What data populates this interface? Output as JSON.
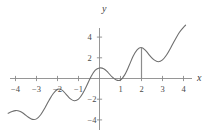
{
  "figure": {
    "background_color": "#ffffff",
    "axis_color": "#8a8a8a",
    "curve_color": "#6e6e6e",
    "drop_line_color": "#8c8c8c",
    "text_color": "#4a4a4a"
  },
  "axes": {
    "x_label": "x",
    "y_label": "y",
    "x_ticks": [
      {
        "value": -4,
        "label": "−4"
      },
      {
        "value": -3,
        "label": "−3"
      },
      {
        "value": -2,
        "label": "−2"
      },
      {
        "value": -1,
        "label": "−1"
      },
      {
        "value": 1,
        "label": "1"
      },
      {
        "value": 2,
        "label": "2"
      },
      {
        "value": 3,
        "label": "3"
      },
      {
        "value": 4,
        "label": "4"
      }
    ],
    "y_ticks": [
      {
        "value": 4,
        "label": "4"
      },
      {
        "value": 2,
        "label": "2"
      },
      {
        "value": -2,
        "label": "−2"
      },
      {
        "value": -4,
        "label": "−4"
      }
    ]
  },
  "chart_data": {
    "type": "line",
    "title": "",
    "xlabel": "x",
    "ylabel": "y",
    "xlim": [
      -4.35,
      4.15
    ],
    "ylim": [
      -4.6,
      5.2
    ],
    "grid": false,
    "legend": null,
    "series": [
      {
        "name": "f(x)",
        "x": [
          -4.35,
          -4.2,
          -4.0,
          -3.8,
          -3.6,
          -3.4,
          -3.2,
          -3.0,
          -2.8,
          -2.6,
          -2.4,
          -2.2,
          -2.0,
          -1.8,
          -1.6,
          -1.4,
          -1.2,
          -1.0,
          -0.8,
          -0.6,
          -0.4,
          -0.2,
          0.0,
          0.2,
          0.4,
          0.6,
          0.8,
          1.0,
          1.2,
          1.4,
          1.6,
          1.8,
          2.0,
          2.2,
          2.4,
          2.6,
          2.8,
          3.0,
          3.2,
          3.4,
          3.6,
          3.8,
          4.0,
          4.1
        ],
        "y": [
          -3.35,
          -3.22,
          -3.1,
          -3.16,
          -3.4,
          -3.72,
          -3.95,
          -3.9,
          -3.5,
          -2.85,
          -2.1,
          -1.45,
          -1.05,
          -1.1,
          -1.5,
          -1.95,
          -2.15,
          -2.0,
          -1.45,
          -0.65,
          0.2,
          0.8,
          1.02,
          0.95,
          0.6,
          0.15,
          -0.15,
          -0.15,
          0.35,
          1.2,
          2.15,
          2.8,
          3.0,
          2.7,
          2.2,
          1.8,
          1.62,
          1.8,
          2.3,
          3.0,
          3.75,
          4.45,
          4.95,
          5.15
        ]
      }
    ],
    "annotations": [
      {
        "type": "drop-line",
        "name": "vertical-drop-line-at-x2",
        "x": 2,
        "y_from": 0,
        "y_to": 3.0
      }
    ]
  }
}
